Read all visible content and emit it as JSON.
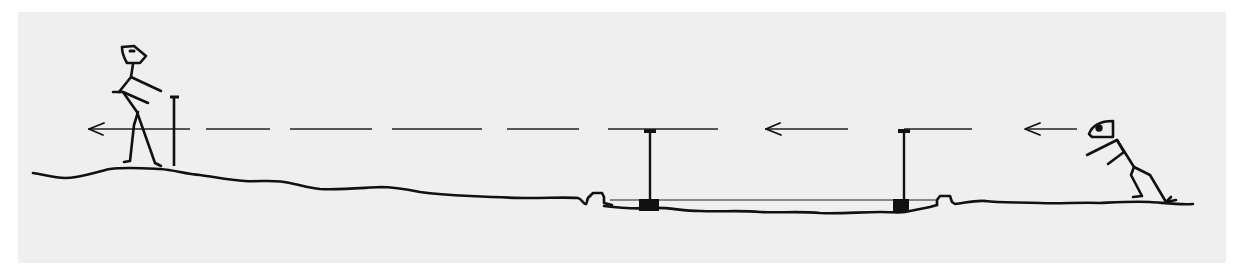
{
  "figure": {
    "background_color": "#efefef",
    "ink_color": "#111111"
  },
  "elements": {
    "left_figure": {
      "label": "standing-person-with-staff",
      "pose": "standing, facing right, holding staff"
    },
    "staff": {
      "label": "sighting-staff"
    },
    "sight_line": {
      "label": "dashed sight line",
      "direction": "leftward",
      "style": "dashed",
      "arrows": 3
    },
    "post_left": {
      "label": "sighting-post-left"
    },
    "post_right": {
      "label": "sighting-post-right"
    },
    "trench": {
      "label": "sunken trench with level bar between posts"
    },
    "right_figure": {
      "label": "crouching-observer",
      "pose": "leaning forward, sighting leftward"
    },
    "ground": {
      "label": "ground profile"
    }
  }
}
